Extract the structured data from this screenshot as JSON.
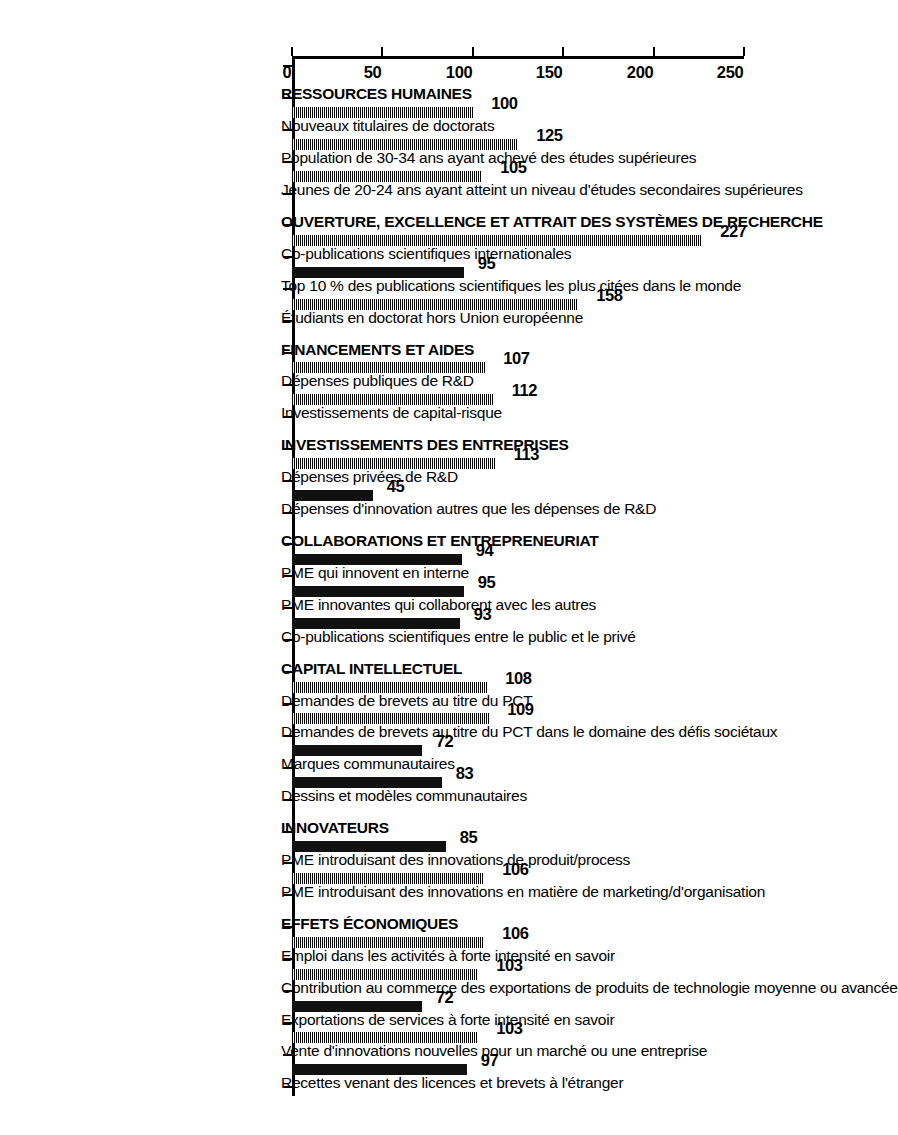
{
  "chart_data": {
    "type": "bar",
    "title": "",
    "subtitle": "",
    "xlabel": "",
    "ylabel": "",
    "ylim": [
      0,
      250
    ],
    "yticks": [
      0,
      50,
      100,
      150,
      200,
      250
    ],
    "ytick_labels": [
      "0",
      "50",
      "100",
      "150",
      "200",
      "250"
    ],
    "grid": false,
    "legend": "none",
    "orientation": "vertical-bars-on-rotated-page",
    "bar_fill_styles": [
      "hatched",
      "solid"
    ],
    "categories": [
      "RESSOURCES HUMAINES",
      "Nouveaux titulaires de doctorats",
      "Population de 30-34 ans ayant achevé des études supérieures",
      "Jeunes de 20-24 ans ayant atteint un niveau d'études secondaires supérieures",
      "OUVERTURE, EXCELLENCE ET ATTRAIT DES SYSTÈMES DE RECHERCHE",
      "Co-publications scientifiques internationales",
      "Top 10 % des publications scientifiques les plus citées dans le monde",
      "Étudiants en doctorat hors Union européenne",
      "FINANCEMENTS ET AIDES",
      "Dépenses publiques de R&D",
      "Investissements de capital-risque",
      "INVESTISSEMENTS DES ENTREPRISES",
      "Dépenses privées de R&D",
      "Dépenses d'innovation autres que les dépenses de R&D",
      "COLLABORATIONS ET ENTREPRENEURIAT",
      "PME qui innovent en interne",
      "PME innovantes qui collaborent avec les autres",
      "Co-publications scientifiques entre le public et le privé",
      "CAPITAL INTELLECTUEL",
      "Demandes de brevets au titre du PCT",
      "Demandes de brevets au titre du PCT dans le domaine des défis sociétaux",
      "Marques communautaires",
      "Dessins et modèles communautaires",
      "INNOVATEURS",
      "PME introduisant des innovations de produit/process",
      "PME introduisant des innovations en matière de marketing/d'organisation",
      "EFFETS ÉCONOMIQUES",
      "Emploi dans les activités à forte intensité en savoir",
      "Contribution au commerce des exportations de produits de technologie moyenne ou avancée",
      "Exportations de services à forte intensité en savoir",
      "Vente d'innovations nouvelles pour un marché ou une entreprise",
      "Recettes venant des licences et brevets à l'étranger"
    ],
    "is_group_header": [
      true,
      false,
      false,
      false,
      true,
      false,
      false,
      false,
      true,
      false,
      false,
      true,
      false,
      false,
      true,
      false,
      false,
      false,
      true,
      false,
      false,
      false,
      false,
      true,
      false,
      false,
      true,
      false,
      false,
      false,
      false,
      false
    ],
    "values": [
      null,
      100,
      125,
      105,
      null,
      227,
      95,
      158,
      null,
      107,
      112,
      null,
      113,
      45,
      null,
      94,
      95,
      93,
      null,
      108,
      109,
      72,
      83,
      null,
      85,
      106,
      null,
      106,
      103,
      72,
      103,
      97
    ],
    "value_labels": [
      "",
      "100",
      "125",
      "105",
      "",
      "227",
      "95",
      "158",
      "",
      "107",
      "112",
      "",
      "113",
      "45",
      "",
      "94",
      "95",
      "93",
      "",
      "108",
      "109",
      "72",
      "83",
      "",
      "85",
      "106",
      "",
      "106",
      "103",
      "72",
      "103",
      "97"
    ],
    "fill": [
      "",
      "hatched",
      "hatched",
      "hatched",
      "",
      "hatched",
      "solid",
      "hatched",
      "",
      "hatched",
      "hatched",
      "",
      "hatched",
      "solid",
      "",
      "solid",
      "solid",
      "solid",
      "",
      "hatched",
      "hatched",
      "solid",
      "solid",
      "",
      "solid",
      "hatched",
      "",
      "hatched",
      "hatched",
      "solid",
      "hatched",
      "solid"
    ]
  }
}
